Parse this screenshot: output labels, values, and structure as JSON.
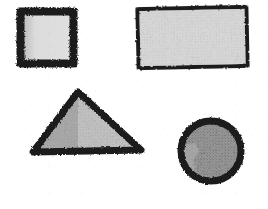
{
  "page": {
    "width": 268,
    "height": 209,
    "background_color": "#ffffff",
    "medium": "scanned hand-drawn grayscale shapes",
    "shape_count": 4
  },
  "palette": {
    "paper": "#ffffff",
    "outline_dark": "#1c1c1c",
    "outline_soft": "#3a3a3a",
    "fill_very_light": "#dcdcdc",
    "fill_light": "#d2d2d2",
    "fill_medium": "#b0b0b0",
    "fill_medium_dark": "#8e8e8e",
    "fill_dark": "#6f6f6f"
  },
  "shapes": [
    {
      "id": "square",
      "label": "Square",
      "kind": "square",
      "position": "top-left",
      "bbox": {
        "x": 16,
        "y": 7,
        "width": 62,
        "height": 61
      },
      "outline_color": "#1c1c1c",
      "outline_weight": 8,
      "outline_style": "thick rough charcoal",
      "fill_color": "#dcdcdc",
      "fill_texture": "fine halftone dither",
      "shading_note": "narrow medium-gray band along the left interior edge"
    },
    {
      "id": "rectangle",
      "label": "Rectangle",
      "kind": "rectangle",
      "position": "top-right",
      "bbox": {
        "x": 135,
        "y": 5,
        "width": 115,
        "height": 65
      },
      "outline_color": "#1c1c1c",
      "outline_weight": 4,
      "outline_style": "thin rough charcoal",
      "fill_color": "#d2d2d2",
      "fill_texture": "fine halftone dither",
      "shading_note": "slightly tilted; even light-gray fill"
    },
    {
      "id": "triangle",
      "label": "Triangle",
      "kind": "triangle",
      "position": "bottom-left",
      "bbox": {
        "x": 28,
        "y": 88,
        "width": 117,
        "height": 67
      },
      "apex": {
        "x": 78,
        "y": 90
      },
      "outline_color": "#1c1c1c",
      "outline_weight": 7,
      "outline_style": "thick rough charcoal",
      "fill_color": "#b0b0b0",
      "fill_texture": "coarse halftone dither",
      "shading_note": "vertical tonal split: darker left of apex, lighter right"
    },
    {
      "id": "circle",
      "label": "Circle",
      "kind": "circle",
      "position": "bottom-right",
      "bbox": {
        "x": 177,
        "y": 117,
        "width": 68,
        "height": 68
      },
      "center": {
        "x": 211,
        "y": 151
      },
      "radius": 34,
      "outline_color": "#1c1c1c",
      "outline_weight": 7,
      "outline_style": "thick rough charcoal ring",
      "fill_color": "#8e8e8e",
      "fill_texture": "dense halftone dither",
      "shading_note": "lighter irregular patch on the left side"
    }
  ]
}
